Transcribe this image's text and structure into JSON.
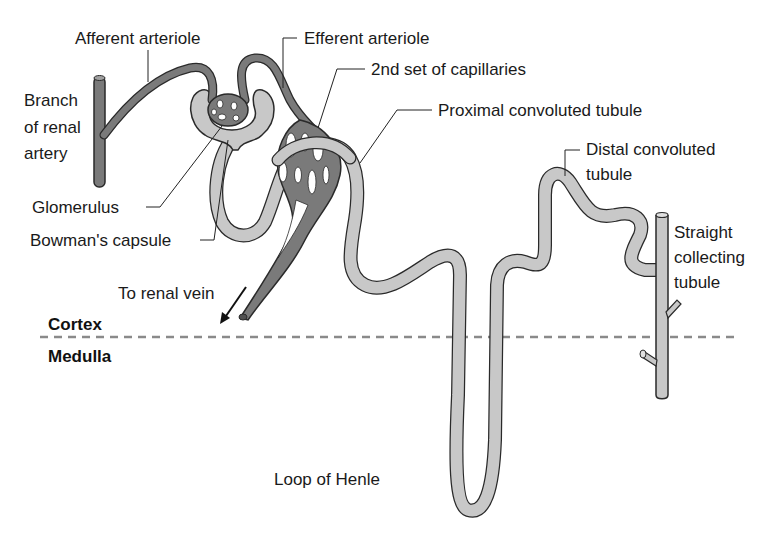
{
  "diagram": {
    "colors": {
      "vessel_fill": "#7a7a7a",
      "tubule_fill": "#c8c8c8",
      "outline": "#2a2a2a",
      "divider": "#8a8a8a",
      "text": "#1a1a1a"
    },
    "labels": {
      "afferent_arteriole": "Afferent arteriole",
      "efferent_arteriole": "Efferent arteriole",
      "second_capillaries": "2nd set of capillaries",
      "proximal_tubule": "Proximal convoluted tubule",
      "distal_tubule_line1": "Distal convoluted",
      "distal_tubule_line2": "tubule",
      "branch_line1": "Branch",
      "branch_line2": "of renal",
      "branch_line3": "artery",
      "glomerulus": "Glomerulus",
      "bowmans_capsule": "Bowman's capsule",
      "to_renal_vein": "To renal vein",
      "straight_line1": "Straight",
      "straight_line2": "collecting",
      "straight_line3": "tubule",
      "loop_of_henle": "Loop of Henle"
    },
    "regions": {
      "cortex": "Cortex",
      "medulla": "Medulla"
    }
  }
}
